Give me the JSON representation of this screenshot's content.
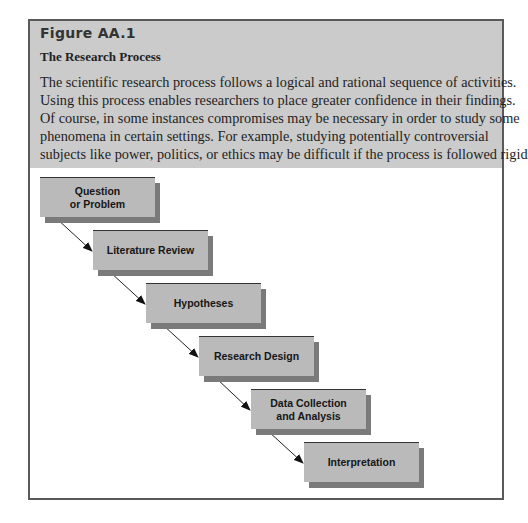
{
  "figure": {
    "label": "Figure AA.1",
    "title": "The Research Process",
    "description_lines": [
      "The scientific research process follows a logical and rational sequence of activities.",
      "Using this process enables researchers to place greater confidence in their findings.",
      "Of course, in some instances compromises may be necessary in order to study some",
      "phenomena in certain settings. For example, studying potentially controversial",
      "subjects like power, politics, or ethics may be difficult if the process is followed rigidly."
    ]
  },
  "diagram": {
    "type": "staircase-flow",
    "steps": [
      {
        "label": "Question\nor Problem"
      },
      {
        "label": "Literature Review"
      },
      {
        "label": "Hypotheses"
      },
      {
        "label": "Research Design"
      },
      {
        "label": "Data Collection\nand Analysis"
      },
      {
        "label": "Interpretation"
      }
    ],
    "colors": {
      "box_fill": "#bababa",
      "box_shadow": "#7a7a7a",
      "header_bg": "#cbcbcb",
      "frame_border": "#5a5a5a"
    }
  }
}
